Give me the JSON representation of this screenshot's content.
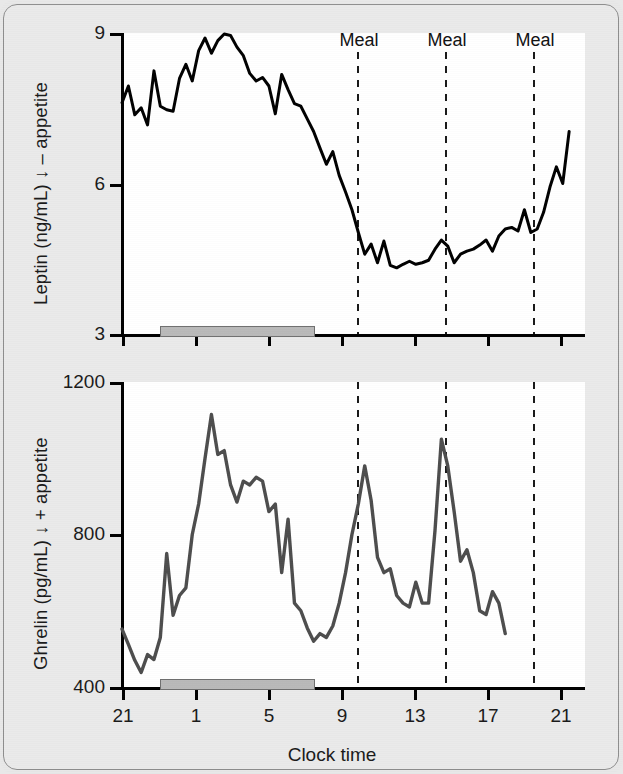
{
  "figure": {
    "background_color": "#e8e8e8",
    "plot_background_color": "#ffffff",
    "frame_border_color": "#8e8e8e"
  },
  "annotations": {
    "meal_label": "Meal",
    "meal_labels": [
      "Meal",
      "Meal",
      "Meal"
    ],
    "meal_line_times": [
      9.2,
      14.0,
      19.0
    ],
    "meal_line_color": "#000000",
    "sleep_bar_color": "#b9b9b9",
    "sleep_bar_start_time": 22.3,
    "sleep_bar_end_time": 7.0
  },
  "chart_data": [
    {
      "id": "leptin",
      "type": "line",
      "title": "",
      "xlabel": "Clock time",
      "ylabel": "Leptin (ng/mL) ↓ – appetite",
      "ylabel_parts": {
        "analyte": "Leptin",
        "units": "(ng/mL)",
        "arrow": "↓",
        "effect": "– appetite"
      },
      "line_color": "#000000",
      "line_width": 3,
      "grid": false,
      "legend": "none",
      "xlim": [
        20.6,
        22.6
      ],
      "ylim": [
        3,
        9
      ],
      "yticks": [
        3,
        6,
        9
      ],
      "yticklabels": [
        "3",
        "6",
        "9"
      ],
      "xticks": [
        21,
        1,
        5,
        9,
        13,
        17,
        21
      ],
      "xticklabels": [
        "21",
        "1",
        "5",
        "9",
        "13",
        "17",
        "21"
      ],
      "x": [
        0.0,
        0.35,
        0.7,
        1.05,
        1.4,
        1.75,
        2.1,
        2.45,
        2.8,
        3.15,
        3.5,
        3.85,
        4.2,
        4.55,
        4.9,
        5.25,
        5.6,
        5.95,
        6.3,
        6.65,
        7.0,
        7.35,
        7.7,
        8.05,
        8.4,
        8.75,
        9.1,
        9.45,
        9.8,
        10.15,
        10.5,
        10.85,
        11.2,
        11.55,
        11.9,
        12.25,
        12.6,
        12.95,
        13.3,
        13.65,
        14.0,
        14.35,
        14.7,
        15.05,
        15.4,
        15.75,
        16.1,
        16.45,
        16.8,
        17.15,
        17.5,
        17.85,
        18.2,
        18.55,
        18.9,
        19.25,
        19.6,
        19.95,
        20.3,
        20.65,
        21.0,
        21.35,
        21.7,
        22.05,
        22.4,
        22.75,
        23.1,
        23.45,
        23.8,
        24.15,
        24.5
      ],
      "values": [
        7.62,
        7.95,
        7.38,
        7.52,
        7.18,
        8.25,
        7.55,
        7.48,
        7.45,
        8.1,
        8.38,
        8.05,
        8.65,
        8.9,
        8.6,
        8.85,
        8.98,
        8.95,
        8.72,
        8.55,
        8.2,
        8.05,
        8.12,
        7.95,
        7.4,
        8.18,
        7.88,
        7.6,
        7.55,
        7.3,
        7.05,
        6.72,
        6.4,
        6.65,
        6.18,
        5.85,
        5.5,
        5.05,
        4.62,
        4.82,
        4.45,
        4.88,
        4.4,
        4.35,
        4.42,
        4.48,
        4.42,
        4.45,
        4.5,
        4.72,
        4.9,
        4.78,
        4.45,
        4.62,
        4.68,
        4.72,
        4.8,
        4.9,
        4.68,
        4.98,
        5.12,
        5.15,
        5.08,
        5.5,
        5.05,
        5.12,
        5.45,
        5.95,
        6.35,
        6.02,
        7.05
      ]
    },
    {
      "id": "ghrelin",
      "type": "line",
      "title": "",
      "xlabel": "Clock time",
      "ylabel": "Ghrelin (pg/mL) ↓ + appetite",
      "ylabel_parts": {
        "analyte": "Ghrelin",
        "units": "(pg/mL)",
        "arrow": "↓",
        "effect": "+ appetite"
      },
      "line_color": "#4d4d4d",
      "line_width": 3.4,
      "grid": false,
      "legend": "none",
      "xlim": [
        20.6,
        22.6
      ],
      "ylim": [
        400,
        1200
      ],
      "yticks": [
        400,
        800,
        1200
      ],
      "yticklabels": [
        "400",
        "800",
        "1200"
      ],
      "xticks": [
        21,
        1,
        5,
        9,
        13,
        17,
        21
      ],
      "xticklabels": [
        "21",
        "1",
        "5",
        "9",
        "13",
        "17",
        "21"
      ],
      "x": [
        0.0,
        0.35,
        0.7,
        1.05,
        1.4,
        1.75,
        2.1,
        2.45,
        2.8,
        3.15,
        3.5,
        3.85,
        4.2,
        4.55,
        4.9,
        5.25,
        5.6,
        5.95,
        6.3,
        6.65,
        7.0,
        7.35,
        7.7,
        8.05,
        8.4,
        8.75,
        9.1,
        9.45,
        9.8,
        10.15,
        10.5,
        10.85,
        11.2,
        11.55,
        11.9,
        12.25,
        12.6,
        12.95,
        13.3,
        13.65,
        14.0,
        14.35,
        14.7,
        15.05,
        15.4,
        15.75,
        16.1,
        16.45,
        16.8,
        17.15,
        17.5,
        17.85,
        18.2,
        18.55,
        18.9,
        19.25,
        19.6,
        19.95,
        20.3,
        20.65,
        21.0,
        21.35,
        21.7,
        22.05,
        22.4,
        22.75,
        23.1,
        23.45,
        23.8,
        24.15,
        24.5
      ],
      "values": [
        552,
        512,
        470,
        438,
        485,
        472,
        530,
        750,
        588,
        640,
        660,
        800,
        880,
        1000,
        1115,
        1010,
        1020,
        930,
        885,
        940,
        930,
        950,
        940,
        860,
        880,
        700,
        840,
        620,
        600,
        555,
        520,
        540,
        530,
        560,
        620,
        700,
        800,
        880,
        980,
        890,
        740,
        700,
        710,
        640,
        620,
        610,
        675,
        620,
        620,
        810,
        1050,
        980,
        860,
        730,
        760,
        700,
        600,
        590,
        650,
        620,
        540
      ]
    }
  ]
}
